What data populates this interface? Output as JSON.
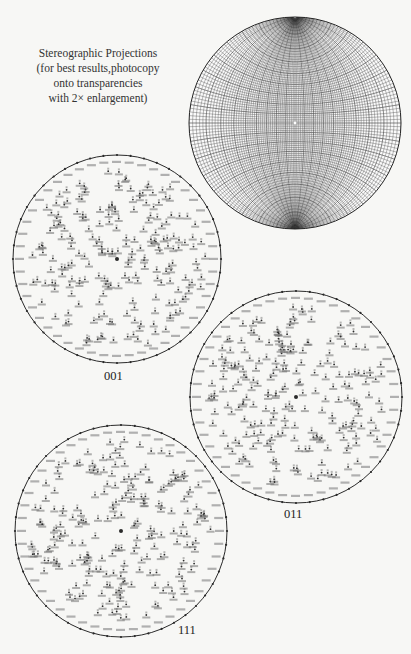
{
  "caption": {
    "lines": [
      "Stereographic Projections",
      "(for best results,photocopy",
      "onto transparencies",
      "with 2× enlargement)"
    ]
  },
  "wulff_net": {
    "name": "Wulff net",
    "cx": 295,
    "cy": 123,
    "r": 106,
    "grid_step_deg": 2,
    "line_color": "#3a3a3a"
  },
  "projections": [
    {
      "id": "001",
      "label": "001",
      "cx": 117,
      "cy": 259,
      "r": 104,
      "label_x": 104,
      "label_y": 369,
      "pole_count": 210,
      "seed": 11
    },
    {
      "id": "011",
      "label": "011",
      "cx": 296,
      "cy": 397,
      "r": 106,
      "label_x": 284,
      "label_y": 507,
      "pole_count": 220,
      "seed": 23
    },
    {
      "id": "111",
      "label": "111",
      "cx": 121,
      "cy": 531,
      "r": 106,
      "label_x": 178,
      "label_y": 623,
      "pole_count": 220,
      "seed": 37
    }
  ],
  "colors": {
    "ink": "#2a2a2a",
    "paper": "#f7f7f5"
  }
}
